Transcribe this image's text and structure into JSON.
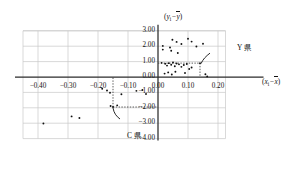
{
  "chart_data": {
    "type": "scatter",
    "title": "",
    "xlabel": "(x_i - x̄)",
    "ylabel": "(y_i - ȳ)",
    "xlabel_display": "(x",
    "ylabel_display": "(y",
    "xlim": [
      -0.45,
      0.23
    ],
    "ylim": [
      -4.0,
      3.0
    ],
    "grid": true,
    "legend": "none",
    "xticks": [
      -0.4,
      -0.3,
      -0.2,
      -0.1,
      0.0,
      0.1,
      0.2
    ],
    "xticklabels": [
      "-0.40",
      "-0.30",
      "-0.20",
      "-0.10",
      "0.00",
      "0.10",
      "0.20"
    ],
    "yticks": [
      3.0,
      2.0,
      1.0,
      0.0,
      -1.0,
      -2.0,
      -3.0,
      -4.0
    ],
    "yticklabels": [
      "3.00",
      "2.00",
      "1.00",
      "0.00",
      "-1.00",
      "-2.00",
      "-3.00",
      "-4.00"
    ],
    "points": [
      [
        0.016,
        2.02
      ],
      [
        0.016,
        1.78
      ],
      [
        0.048,
        2.42
      ],
      [
        0.04,
        1.92
      ],
      [
        0.044,
        1.7
      ],
      [
        0.062,
        2.28
      ],
      [
        0.078,
        2.14
      ],
      [
        0.066,
        1.56
      ],
      [
        0.1,
        2.48
      ],
      [
        0.112,
        2.3
      ],
      [
        0.128,
        1.98
      ],
      [
        0.15,
        2.16
      ],
      [
        0.012,
        0.92
      ],
      [
        0.024,
        0.86
      ],
      [
        0.03,
        0.74
      ],
      [
        0.036,
        0.9
      ],
      [
        0.044,
        0.8
      ],
      [
        0.05,
        0.94
      ],
      [
        0.056,
        0.7
      ],
      [
        0.062,
        0.88
      ],
      [
        0.07,
        0.82
      ],
      [
        0.078,
        0.66
      ],
      [
        0.086,
        0.78
      ],
      [
        0.096,
        0.84
      ],
      [
        0.104,
        0.52
      ],
      [
        0.112,
        0.62
      ],
      [
        0.022,
        0.22
      ],
      [
        0.034,
        0.3
      ],
      [
        0.046,
        0.16
      ],
      [
        0.058,
        0.34
      ],
      [
        0.09,
        0.26
      ],
      [
        0.14,
        0.9
      ],
      [
        0.158,
        0.18
      ],
      [
        0.164,
        0.04
      ],
      [
        -0.15,
        -1.95
      ],
      [
        -0.158,
        -1.88
      ],
      [
        -0.136,
        -1.84
      ],
      [
        -0.186,
        -0.76
      ],
      [
        -0.17,
        -0.88
      ],
      [
        -0.16,
        -1.02
      ],
      [
        -0.122,
        -1.12
      ],
      [
        -0.072,
        -0.9
      ],
      [
        -0.052,
        -0.84
      ],
      [
        -0.04,
        -1.1
      ],
      [
        -0.288,
        -2.56
      ],
      [
        -0.262,
        -2.66
      ],
      [
        -0.382,
        -3.02
      ]
    ],
    "annotations": [
      {
        "label": "Y 県",
        "x": 0.14,
        "y": 0.9,
        "guide": "dotted"
      },
      {
        "label": "C 県",
        "x": -0.15,
        "y": -1.95,
        "guide": "dotted"
      }
    ],
    "guide_lines": [
      {
        "name": "Y-prefecture-horizontal",
        "from": [
          0.0,
          0.9
        ],
        "to": [
          0.14,
          0.9
        ]
      },
      {
        "name": "Y-prefecture-vertical",
        "from": [
          0.14,
          0.9
        ],
        "to": [
          0.14,
          0.0
        ]
      },
      {
        "name": "C-prefecture-horizontal",
        "from": [
          -0.15,
          -1.95
        ],
        "to": [
          0.0,
          -1.95
        ]
      },
      {
        "name": "C-prefecture-vertical",
        "from": [
          -0.15,
          -1.95
        ],
        "to": [
          -0.15,
          0.0
        ]
      }
    ]
  },
  "axes": {
    "y_axis_label": "(y",
    "x_axis_label": "(x",
    "y_sub": "i",
    "x_sub": "i",
    "minus": "−",
    "ybar": "y",
    "xbar": "x",
    "close_paren": ")"
  },
  "annotation_labels": {
    "y_prefecture": "Y 県",
    "c_prefecture": "C 県"
  },
  "colors": {
    "axis": "#2b2b2b",
    "grid": "#c9c9c9",
    "point": "#111111",
    "guide": "#333333",
    "text": "#111111"
  }
}
